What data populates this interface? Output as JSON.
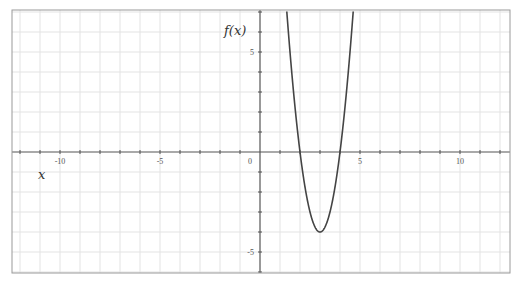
{
  "chart_data": {
    "type": "line",
    "title": "",
    "xlabel": "x",
    "ylabel": "f(x)",
    "xlim": [
      -12.4,
      12.5
    ],
    "ylim": [
      -6.05,
      7.1
    ],
    "grid": true,
    "grid_step": 1,
    "legend": null,
    "x_ticks": [
      -10,
      -5,
      0,
      5,
      10
    ],
    "x_tick_labels": [
      "-10",
      "-5",
      "0",
      "5",
      "10"
    ],
    "y_ticks": [
      5,
      -5
    ],
    "y_tick_labels": [
      "5",
      "-5"
    ],
    "series": [
      {
        "name": "f(x)",
        "expression": "4(x-3)^2 - 4",
        "vertex": [
          3,
          -4
        ],
        "roots": [
          2,
          4
        ],
        "x": [
          1.33,
          1.5,
          1.75,
          2,
          2.25,
          2.5,
          2.75,
          3,
          3.25,
          3.5,
          3.75,
          4,
          4.25,
          4.5,
          4.67
        ],
        "values": [
          7.16,
          5,
          2.25,
          0,
          -1.75,
          -3,
          -3.75,
          -4,
          -3.75,
          -3,
          -1.75,
          0,
          2.25,
          5,
          7.16
        ],
        "color": "#444444"
      }
    ]
  },
  "colors": {
    "grid": "#e3e3e3",
    "axis": "#555555",
    "frame": "#9a9a9a",
    "curve": "#444444"
  },
  "plot": {
    "left": 12,
    "top": 10,
    "right": 510,
    "bottom": 273,
    "origin_px": [
      260,
      152
    ],
    "px_per_unit": 20
  }
}
